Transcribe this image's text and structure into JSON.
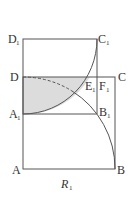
{
  "figure": {
    "caption": {
      "main": "R",
      "sub": "1"
    },
    "points": [
      {
        "name": "D",
        "sub": "1"
      },
      {
        "name": "C",
        "sub": "1"
      },
      {
        "name": "D",
        "sub": ""
      },
      {
        "name": "E",
        "sub": "1"
      },
      {
        "name": "F",
        "sub": "1"
      },
      {
        "name": "C",
        "sub": ""
      },
      {
        "name": "A",
        "sub": "1"
      },
      {
        "name": "B",
        "sub": "1"
      },
      {
        "name": "A",
        "sub": ""
      },
      {
        "name": "B",
        "sub": ""
      }
    ],
    "colors": {
      "line": "#555555",
      "shade": "#dcdcdc",
      "text": "#333333"
    }
  }
}
